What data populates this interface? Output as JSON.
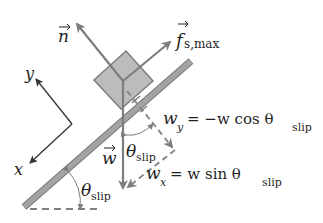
{
  "diagram": {
    "type": "free-body diagram, block on incline at slipping angle",
    "colors": {
      "ramp": "#9a9a9a",
      "ramp_edge": "#7a7a7a",
      "block": "#b8b8b8",
      "arrow": "#7d7d7d",
      "axes": "#333333",
      "text": "#1f1f1f"
    },
    "vectors": {
      "normal": {
        "symbol": "n"
      },
      "friction": {
        "symbol": "f",
        "subscript": "s,max"
      },
      "weight": {
        "symbol": "w"
      }
    },
    "axes": {
      "x_label": "x",
      "y_label": "y"
    },
    "components": {
      "wy": {
        "lhs": "w",
        "lhs_sub": "y",
        "rhs": "= −w cos θ",
        "rhs_sub": "slip"
      },
      "wx": {
        "lhs": "w",
        "lhs_sub": "x",
        "rhs": "= w sin θ",
        "rhs_sub": "slip"
      }
    },
    "angles": {
      "incline": {
        "symbol": "θ",
        "subscript": "slip"
      },
      "weight_angle": {
        "symbol": "θ",
        "subscript": "slip"
      }
    }
  }
}
